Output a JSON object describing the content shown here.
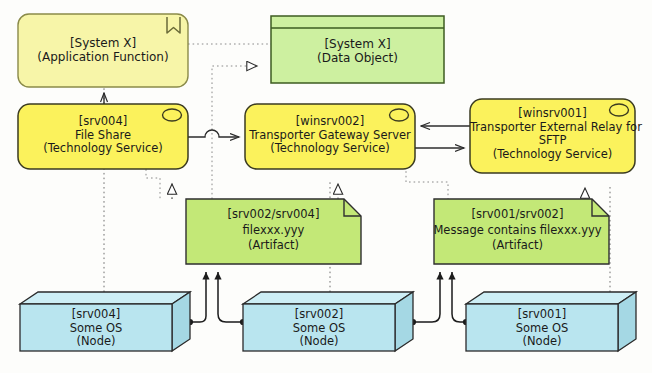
{
  "diagram": {
    "notation": "ArchiMate",
    "canvas": {
      "width": 652,
      "height": 373
    },
    "background_color": "#fdfdfb",
    "line_color": "#2b2b2b"
  },
  "palette": {
    "application_fill": "#f7f5a8",
    "application_stroke": "#8a8a4a",
    "technology_service_fill": "#fbf25c",
    "technology_service_stroke": "#3a3a20",
    "data_object_fill": "#cdf0a0",
    "data_object_stroke": "#3d5c22",
    "artifact_fill": "#c3e877",
    "artifact_stroke": "#2f2f2f",
    "node_fill": "#b9e5ef",
    "node_stroke": "#2a2a2a",
    "node_top_fill": "#cdeef5",
    "node_side_fill": "#a5d8e4"
  },
  "nodes": [
    {
      "id": "app-function-systemx",
      "name": "application-function-system-x",
      "line1": "[System X]",
      "line2": "(Application Function)",
      "line3": "",
      "type": "Application Function",
      "icon": "function-chevron-icon",
      "shape": "rounded-rect",
      "fill": "#f7f5a8",
      "stroke": "#8a8a4a",
      "x": 18,
      "y": 14,
      "w": 170,
      "h": 73
    },
    {
      "id": "data-object-systemx",
      "name": "data-object-system-x",
      "line1": "[System X]",
      "line2": "(Data Object)",
      "line3": "",
      "type": "Data Object",
      "icon": "data-object-header-band",
      "shape": "data-object",
      "fill": "#cdf0a0",
      "stroke": "#3d5c22",
      "x": 271,
      "y": 16,
      "w": 173,
      "h": 67
    },
    {
      "id": "tech-service-srv004",
      "name": "technology-service-srv004-file-share",
      "line1": "[srv004]",
      "line2": "File Share",
      "line3": "(Technology Service)",
      "type": "Technology Service",
      "icon": "service-oval-icon",
      "shape": "rounded-rect",
      "fill": "#fbf25c",
      "stroke": "#3a3a20",
      "x": 18,
      "y": 104,
      "w": 170,
      "h": 65
    },
    {
      "id": "tech-service-winsrv002",
      "name": "technology-service-winsrv002-transporter-gateway-server",
      "line1": "[winsrv002]",
      "line2": "Transporter Gateway Server",
      "line3": "(Technology Service)",
      "type": "Technology Service",
      "icon": "service-oval-icon",
      "shape": "rounded-rect",
      "fill": "#fbf25c",
      "stroke": "#3a3a20",
      "x": 245,
      "y": 104,
      "w": 170,
      "h": 65
    },
    {
      "id": "tech-service-winsrv001",
      "name": "technology-service-winsrv001-transporter-external-relay-for-sftp",
      "line1": "[winsrv001]",
      "line2": "Transporter External Relay for",
      "line2b": "SFTP",
      "line3": "(Technology Service)",
      "type": "Technology Service",
      "icon": "service-oval-icon",
      "shape": "rounded-rect",
      "fill": "#fbf25c",
      "stroke": "#3a3a20",
      "x": 470,
      "y": 99,
      "w": 165,
      "h": 74
    },
    {
      "id": "artifact-srv002-srv004",
      "name": "artifact-srv002-srv004-filexxx",
      "line1": "[srv002/srv004]",
      "line2": "filexxx.yyy",
      "line3": "(Artifact)",
      "type": "Artifact",
      "icon": "artifact-folded-corner-icon",
      "shape": "artifact",
      "fill": "#c3e877",
      "stroke": "#2f2f2f",
      "x": 186,
      "y": 199,
      "w": 175,
      "h": 65
    },
    {
      "id": "artifact-srv001-srv002",
      "name": "artifact-srv001-srv002-message-contains-filexxx",
      "line1": "[srv001/srv002]",
      "line2": "Message contains filexxx.yyy",
      "line3": "(Artifact)",
      "type": "Artifact",
      "icon": "artifact-folded-corner-icon",
      "shape": "artifact",
      "fill": "#c3e877",
      "stroke": "#2f2f2f",
      "x": 434,
      "y": 199,
      "w": 175,
      "h": 65
    },
    {
      "id": "node-srv004",
      "name": "node-srv004-some-os",
      "line1": "[srv004]",
      "line2": "Some OS",
      "line3": "(Node)",
      "type": "Node",
      "icon": "node-3d-box-icon",
      "shape": "box3d",
      "fill": "#b9e5ef",
      "stroke": "#2a2a2a",
      "x": 20,
      "y": 292,
      "w": 170,
      "h": 59
    },
    {
      "id": "node-srv002",
      "name": "node-srv002-some-os",
      "line1": "[srv002]",
      "line2": "Some OS",
      "line3": "(Node)",
      "type": "Node",
      "icon": "node-3d-box-icon",
      "shape": "box3d",
      "fill": "#b9e5ef",
      "stroke": "#2a2a2a",
      "x": 243,
      "y": 292,
      "w": 170,
      "h": 59
    },
    {
      "id": "node-srv001",
      "name": "node-srv001-some-os",
      "line1": "[srv001]",
      "line2": "Some OS",
      "line3": "(Node)",
      "type": "Node",
      "icon": "node-3d-box-icon",
      "shape": "box3d",
      "fill": "#b9e5ef",
      "stroke": "#2a2a2a",
      "x": 466,
      "y": 292,
      "w": 170,
      "h": 59
    }
  ],
  "connectors": [
    {
      "name": "access-app-function-to-data-object",
      "style": "dotted",
      "arrowhead": "none",
      "from": "app-function-systemx",
      "to": "data-object-systemx"
    },
    {
      "name": "serving-srv004-to-winsrv002",
      "style": "solid",
      "arrowhead": "open-arrow",
      "from": "tech-service-srv004",
      "to": "tech-service-winsrv002"
    },
    {
      "name": "serving-winsrv001-to-winsrv002",
      "style": "solid",
      "arrowhead": "open-arrow",
      "from": "tech-service-winsrv001",
      "to": "tech-service-winsrv002"
    },
    {
      "name": "serving-winsrv002-to-winsrv001",
      "style": "solid",
      "arrowhead": "open-arrow",
      "from": "tech-service-winsrv002",
      "to": "tech-service-winsrv001"
    },
    {
      "name": "realization-artifact-srv002-srv004-to-srv004",
      "style": "dotted",
      "arrowhead": "hollow-triangle",
      "from": "artifact-srv002-srv004",
      "to": "tech-service-srv004"
    },
    {
      "name": "realization-artifact-srv002-srv004-to-winsrv002",
      "style": "dotted",
      "arrowhead": "hollow-triangle",
      "from": "artifact-srv002-srv004",
      "to": "tech-service-winsrv002"
    },
    {
      "name": "realization-artifact-srv001-srv002-to-winsrv001",
      "style": "dotted",
      "arrowhead": "hollow-triangle",
      "from": "artifact-srv001-srv002",
      "to": "tech-service-winsrv001"
    },
    {
      "name": "access-artifact-to-data-object",
      "style": "dotted",
      "arrowhead": "open-triangle",
      "from": "artifact-srv002-srv004",
      "to": "data-object-systemx"
    },
    {
      "name": "assignment-node-srv004-to-artifact",
      "style": "solid",
      "arrowhead": "filled-arrow",
      "from": "node-srv004",
      "to": "artifact-srv002-srv004"
    },
    {
      "name": "assignment-node-srv002-to-artifact",
      "style": "solid",
      "arrowhead": "filled-arrow",
      "from": "node-srv002",
      "to": "artifact-srv002-srv004"
    },
    {
      "name": "assignment-node-srv002-to-artifact-2",
      "style": "solid",
      "arrowhead": "filled-arrow",
      "from": "node-srv002",
      "to": "artifact-srv001-srv002"
    },
    {
      "name": "assignment-node-srv001-to-artifact",
      "style": "solid",
      "arrowhead": "filled-arrow",
      "from": "node-srv001",
      "to": "artifact-srv001-srv002"
    },
    {
      "name": "dotted-node-srv004-to-app-function",
      "style": "dotted",
      "arrowhead": "none",
      "from": "node-srv004",
      "to": "app-function-systemx"
    },
    {
      "name": "dotted-node-srv002-to-winsrv002",
      "style": "dotted",
      "arrowhead": "none",
      "from": "node-srv002",
      "to": "tech-service-winsrv002"
    },
    {
      "name": "dotted-node-srv001-to-winsrv001",
      "style": "dotted",
      "arrowhead": "none",
      "from": "node-srv001",
      "to": "tech-service-winsrv001"
    }
  ],
  "footer": {
    "text": ""
  }
}
